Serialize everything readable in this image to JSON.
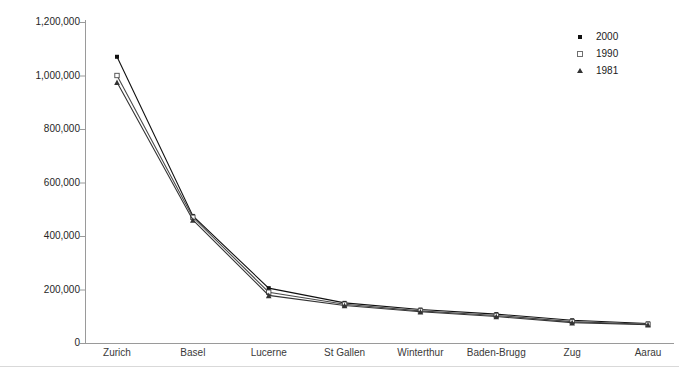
{
  "chart_data": {
    "type": "line",
    "title": "",
    "xlabel": "",
    "ylabel": "Population",
    "categories": [
      "Zurich",
      "Basel",
      "Lucerne",
      "St Gallen",
      "Winterthur",
      "Baden-Brugg",
      "Zug",
      "Aarau"
    ],
    "series": [
      {
        "name": "2000",
        "marker": "filled-square",
        "color": "#111111",
        "values": [
          1070000,
          475000,
          205000,
          150000,
          125000,
          108000,
          85000,
          73000
        ]
      },
      {
        "name": "1990",
        "marker": "open-square",
        "color": "#4a4a4a",
        "values": [
          1000000,
          470000,
          190000,
          145000,
          120000,
          103000,
          80000,
          70000
        ]
      },
      {
        "name": "1981",
        "marker": "triangle",
        "color": "#333333",
        "values": [
          975000,
          460000,
          178000,
          140000,
          117000,
          99000,
          76000,
          68000
        ]
      }
    ],
    "ylim": [
      0,
      1200000
    ],
    "ytick_values": [
      0,
      200000,
      400000,
      600000,
      800000,
      1000000,
      1200000
    ],
    "ytick_labels": [
      "0",
      "200,000",
      "400,000",
      "600,000",
      "800,000",
      "1,000,000",
      "1,200,000"
    ],
    "grid": false,
    "legend_position": "top-right",
    "legend_entries": [
      "2000",
      "1990",
      "1981"
    ]
  },
  "axes": {
    "y_title": "Population"
  }
}
